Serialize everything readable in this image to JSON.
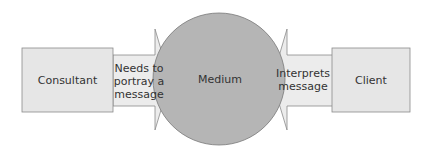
{
  "diagram": {
    "nodes": [
      {
        "id": "consultant",
        "label": "Consultant",
        "shape": "rectangle"
      },
      {
        "id": "medium",
        "label": "Medium",
        "shape": "circle"
      },
      {
        "id": "client",
        "label": "Client",
        "shape": "rectangle"
      }
    ],
    "edges": [
      {
        "from": "consultant",
        "to": "medium",
        "label_lines": [
          "Needs to",
          "portray a",
          "message"
        ]
      },
      {
        "from": "client",
        "to": "medium",
        "label_lines": [
          "Interprets",
          "message"
        ]
      }
    ],
    "colors": {
      "box_fill": "#e6e6e6",
      "box_stroke": "#8a8a8a",
      "arrow_fill": "#ececec",
      "circle_fill": "#b5b5b5",
      "circle_stroke": "#7a7a7a",
      "text": "#333333"
    }
  }
}
